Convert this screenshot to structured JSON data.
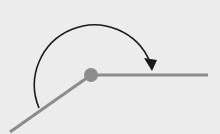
{
  "diagram": {
    "type": "angle",
    "background": "#ececec",
    "vertex": {
      "x": 91,
      "y": 75,
      "r": 7,
      "color": "#8c8c8c"
    },
    "rays": [
      {
        "name": "horizontal-ray",
        "x2": 208,
        "y2": 75,
        "color": "#8c8c8c"
      },
      {
        "name": "lower-left-ray",
        "x2": 10,
        "y2": 132,
        "color": "#8c8c8c"
      }
    ],
    "arc": {
      "color": "#1a1a1a",
      "direction": "clockwise"
    }
  }
}
